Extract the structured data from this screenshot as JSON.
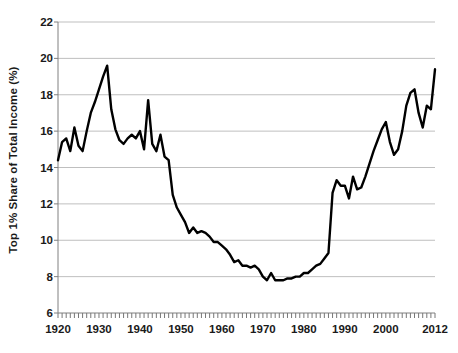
{
  "chart_data": {
    "type": "line",
    "title": "",
    "xlabel": "",
    "ylabel": "Top 1% Share of Total Income (%)",
    "xlim": [
      1920,
      2012
    ],
    "ylim": [
      6,
      22
    ],
    "yticks": [
      6,
      8,
      10,
      12,
      14,
      16,
      18,
      20,
      22
    ],
    "xticks": [
      1920,
      1930,
      1940,
      1950,
      1960,
      1970,
      1980,
      1990,
      2000,
      2012
    ],
    "xtick_labels": [
      "1920",
      "1930",
      "1940",
      "1950",
      "1960",
      "1970",
      "1980",
      "1990",
      "2000",
      "2012"
    ],
    "ytick_labels": [
      "6",
      "8",
      "10",
      "12",
      "14",
      "16",
      "18",
      "20",
      "22"
    ],
    "grid": "horizontal",
    "minor_xticks_every": 1,
    "legend": "none",
    "line_color": "#000000",
    "line_width": 2.4,
    "grid_color": "#bfbfbf",
    "axis_color": "#808080",
    "background": "#ffffff",
    "series": [
      {
        "name": "Top 1% Share of Total Income",
        "x": [
          1920,
          1921,
          1922,
          1923,
          1924,
          1925,
          1926,
          1927,
          1928,
          1929,
          1930,
          1931,
          1932,
          1933,
          1934,
          1935,
          1936,
          1937,
          1938,
          1939,
          1940,
          1941,
          1942,
          1943,
          1944,
          1945,
          1946,
          1947,
          1948,
          1949,
          1950,
          1951,
          1952,
          1953,
          1954,
          1955,
          1956,
          1957,
          1958,
          1959,
          1960,
          1961,
          1962,
          1963,
          1964,
          1965,
          1966,
          1967,
          1968,
          1969,
          1970,
          1971,
          1972,
          1973,
          1974,
          1975,
          1976,
          1977,
          1978,
          1979,
          1980,
          1981,
          1982,
          1983,
          1984,
          1985,
          1986,
          1987,
          1988,
          1989,
          1990,
          1991,
          1992,
          1993,
          1994,
          1995,
          1996,
          1997,
          1998,
          1999,
          2000,
          2001,
          2002,
          2003,
          2004,
          2005,
          2006,
          2007,
          2008,
          2009,
          2010,
          2011,
          2012
        ],
        "y": [
          14.4,
          15.4,
          15.6,
          14.9,
          16.2,
          15.2,
          14.9,
          16.0,
          17.0,
          17.6,
          18.3,
          19.0,
          19.6,
          17.2,
          16.1,
          15.5,
          15.3,
          15.6,
          15.8,
          15.6,
          16.0,
          15.0,
          17.7,
          15.3,
          14.9,
          15.8,
          14.6,
          14.4,
          12.5,
          11.8,
          11.4,
          11.0,
          10.4,
          10.7,
          10.4,
          10.5,
          10.4,
          10.2,
          9.9,
          9.9,
          9.7,
          9.5,
          9.2,
          8.8,
          8.9,
          8.6,
          8.6,
          8.5,
          8.6,
          8.4,
          8.0,
          7.8,
          8.2,
          7.8,
          7.8,
          7.8,
          7.9,
          7.9,
          8.0,
          8.0,
          8.2,
          8.2,
          8.4,
          8.6,
          8.7,
          9.0,
          9.3,
          12.6,
          13.3,
          13.0,
          13.0,
          12.3,
          13.5,
          12.8,
          12.9,
          13.5,
          14.2,
          14.9,
          15.5,
          16.1,
          16.5,
          15.4,
          14.7,
          15.0,
          16.0,
          17.4,
          18.1,
          18.3,
          17.0,
          16.2,
          17.4,
          17.2,
          19.4
        ]
      }
    ]
  },
  "axis": {
    "y_title": "Top 1% Share of Total Income (%)"
  }
}
